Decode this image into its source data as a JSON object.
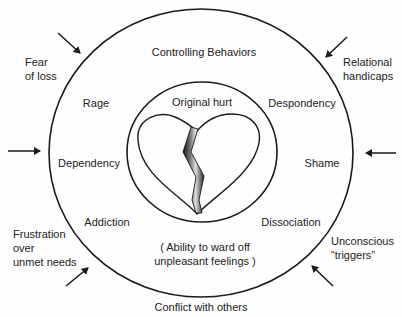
{
  "outer_labels": {
    "top_left": [
      "Fear",
      "of loss"
    ],
    "top_right": [
      "Relational",
      "handicaps"
    ],
    "bottom_left": [
      "Frustration",
      "over",
      "unmet needs"
    ],
    "bottom_right": [
      "Unconscious",
      "“triggers”"
    ],
    "bottom": "Conflict with others"
  },
  "ring_labels": {
    "top": "Controlling Behaviors",
    "rage": "Rage",
    "despondency": "Despondency",
    "dependency": "Dependency",
    "shame": "Shame",
    "addiction": "Addiction",
    "dissociation": "Dissociation",
    "defense": [
      "( Ability to ward off",
      "unpleasant feelings )"
    ]
  },
  "inner": {
    "title": "Original hurt",
    "icon": "broken-heart-icon"
  },
  "arrows": [
    "top-left",
    "top-right",
    "left",
    "right",
    "bottom-left",
    "bottom-right"
  ],
  "colors": {
    "stroke": "#1a1a1a",
    "text": "#222222",
    "background": "#fefefe"
  }
}
